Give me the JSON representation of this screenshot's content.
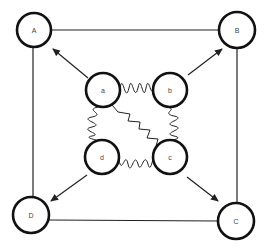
{
  "diagram": {
    "outer_nodes": [
      {
        "id": "A",
        "label": "A",
        "cx": 34,
        "cy": 30,
        "r": 17
      },
      {
        "id": "B",
        "label": "B",
        "cx": 237,
        "cy": 30,
        "r": 18
      },
      {
        "id": "C",
        "label": "C",
        "cx": 236,
        "cy": 221,
        "r": 18
      },
      {
        "id": "D",
        "label": "D",
        "cx": 31,
        "cy": 215,
        "r": 18
      }
    ],
    "inner_nodes": [
      {
        "id": "a",
        "label": "a",
        "cx": 103,
        "cy": 90,
        "r": 17
      },
      {
        "id": "b",
        "label": "b",
        "cx": 170,
        "cy": 90,
        "r": 17
      },
      {
        "id": "c",
        "label": "c",
        "cx": 170,
        "cy": 157,
        "r": 17
      },
      {
        "id": "d",
        "label": "d",
        "cx": 102,
        "cy": 157,
        "r": 17
      }
    ],
    "square_edges": [
      {
        "from": "A",
        "to": "B"
      },
      {
        "from": "B",
        "to": "C"
      },
      {
        "from": "C",
        "to": "D"
      },
      {
        "from": "D",
        "to": "A"
      }
    ],
    "arrows": [
      {
        "from": "a",
        "to": "A"
      },
      {
        "from": "b",
        "to": "B"
      },
      {
        "from": "c",
        "to": "C"
      },
      {
        "from": "d",
        "to": "D"
      }
    ],
    "wavy_edges": [
      {
        "from": "a",
        "to": "b"
      },
      {
        "from": "b",
        "to": "c"
      },
      {
        "from": "c",
        "to": "d"
      },
      {
        "from": "d",
        "to": "a"
      },
      {
        "from": "a",
        "to": "c"
      }
    ]
  }
}
